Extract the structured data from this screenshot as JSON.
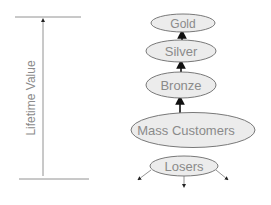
{
  "axis": {
    "label": "Lifetime Value"
  },
  "tiers": [
    {
      "id": "gold",
      "label": "Gold"
    },
    {
      "id": "silver",
      "label": "Silver"
    },
    {
      "id": "bronze",
      "label": "Bronze"
    },
    {
      "id": "mass",
      "label": "Mass Customers"
    },
    {
      "id": "losers",
      "label": "Losers"
    }
  ],
  "colors": {
    "ellipse_fill": "#ececec",
    "ellipse_stroke": "#6a6a6a",
    "text": "#8a8a8a",
    "arrow": "#111111"
  }
}
